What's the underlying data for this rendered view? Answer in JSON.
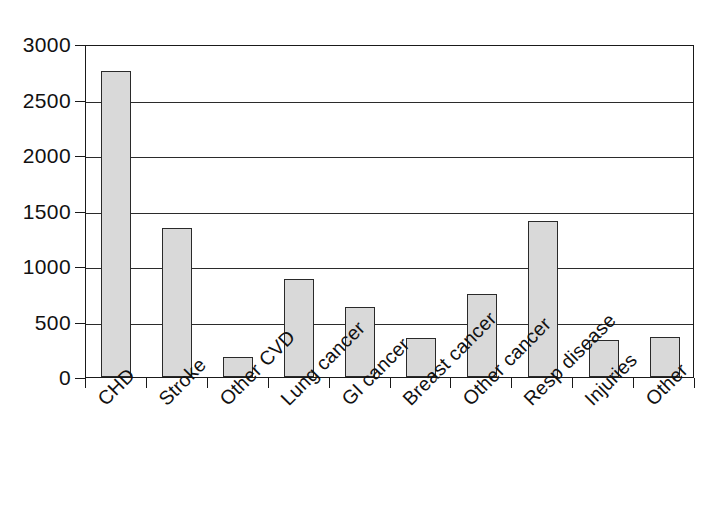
{
  "chart_data": {
    "type": "bar",
    "title": "",
    "subtitle": "",
    "xlabel": "",
    "ylabel": "",
    "categories": [
      "CHD",
      "Stroke",
      "Other CVD",
      "Lung cancer",
      "GI cancer",
      "Breast cancer",
      "Other cancer",
      "Resp disease",
      "Injuries",
      "Other"
    ],
    "values": [
      2760,
      1340,
      180,
      880,
      630,
      350,
      750,
      1410,
      335,
      365
    ],
    "ylim": [
      0,
      3000
    ],
    "ytick_labels": [
      "0",
      "500",
      "1000",
      "1500",
      "2000",
      "2500",
      "3000"
    ],
    "ytick_values": [
      0,
      500,
      1000,
      1500,
      2000,
      2500,
      3000
    ],
    "grid": "horizontal",
    "legend": "none",
    "bar_fill_color": "#d9d9d9",
    "bar_edge_color": "#2a2a2a",
    "axis_color": "#1a1a1a",
    "background_color": "#ffffff"
  }
}
